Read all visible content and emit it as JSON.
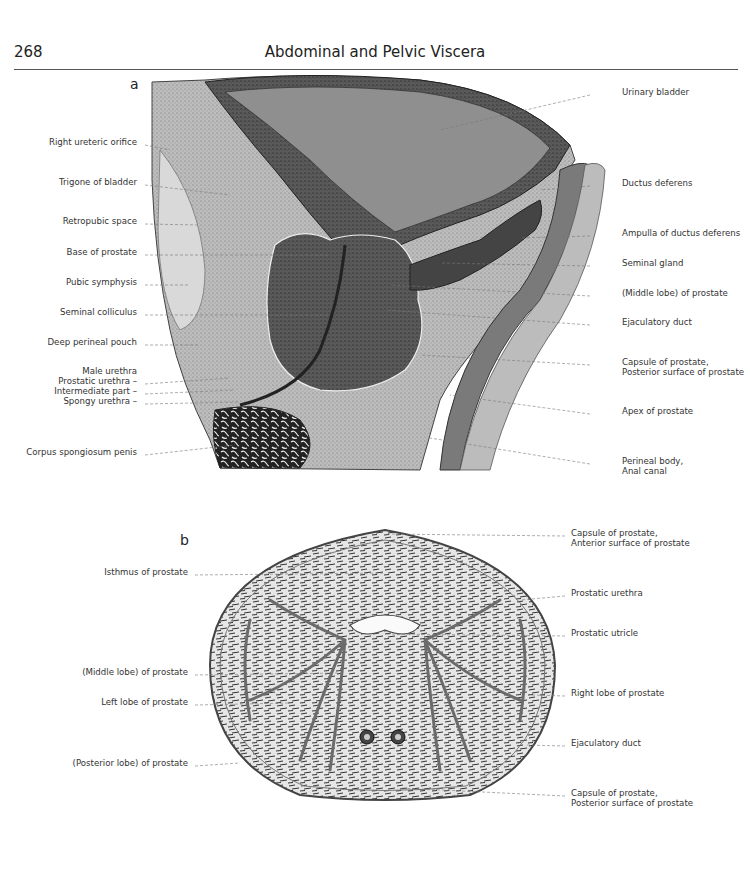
{
  "header": {
    "page_number": "268",
    "title": "Abdominal and Pelvic Viscera"
  },
  "figure_a": {
    "panel_label": "a",
    "labels_left": [
      {
        "text": "Right ureteric orifice",
        "y": 142
      },
      {
        "text": "Trigone of bladder",
        "y": 182
      },
      {
        "text": "Retropubic space",
        "y": 221
      },
      {
        "text": "Base of prostate",
        "y": 252
      },
      {
        "text": "Pubic symphysis",
        "y": 282
      },
      {
        "text": "Seminal colliculus",
        "y": 312
      },
      {
        "text": "Deep perineal pouch",
        "y": 342
      },
      {
        "text": "Male urethra",
        "y": 371
      },
      {
        "text": "Prostatic urethra –",
        "y": 381
      },
      {
        "text": "Intermediate part –",
        "y": 391
      },
      {
        "text": "Spongy urethra –",
        "y": 401
      },
      {
        "text": "Corpus spongiosum penis",
        "y": 452
      }
    ],
    "labels_right": [
      {
        "text": "Urinary bladder",
        "y": 92
      },
      {
        "text": "Ductus deferens",
        "y": 183
      },
      {
        "text": "Ampulla of ductus deferens",
        "y": 233
      },
      {
        "text": "Seminal gland",
        "y": 263
      },
      {
        "text": "(Middle lobe) of prostate",
        "y": 293
      },
      {
        "text": "Ejaculatory duct",
        "y": 322
      },
      {
        "text": "Capsule of prostate,",
        "y": 362
      },
      {
        "text": "Posterior surface of prostate",
        "y": 372
      },
      {
        "text": "Apex of prostate",
        "y": 411
      },
      {
        "text": "Perineal body,",
        "y": 461
      },
      {
        "text": "Anal canal",
        "y": 471
      }
    ]
  },
  "figure_b": {
    "panel_label": "b",
    "labels_left": [
      {
        "text": "Isthmus of prostate",
        "y": 572
      },
      {
        "text": "(Middle lobe) of prostate",
        "y": 672
      },
      {
        "text": "Left lobe of prostate",
        "y": 702
      },
      {
        "text": "(Posterior lobe) of prostate",
        "y": 763
      }
    ],
    "labels_right": [
      {
        "text": "Capsule of prostate,",
        "y": 533
      },
      {
        "text": "Anterior surface of prostate",
        "y": 543
      },
      {
        "text": "Prostatic urethra",
        "y": 593
      },
      {
        "text": "Prostatic utricle",
        "y": 633
      },
      {
        "text": "Right lobe of prostate",
        "y": 693
      },
      {
        "text": "Ejaculatory duct",
        "y": 743
      },
      {
        "text": "Capsule of prostate,",
        "y": 793
      },
      {
        "text": "Posterior surface of prostate",
        "y": 803
      }
    ]
  },
  "colors": {
    "text": "#333333",
    "rule": "#555555",
    "tissue_light": "#c9c9c9",
    "tissue_mid": "#8a8a8a",
    "tissue_dark": "#3c3c3c"
  }
}
